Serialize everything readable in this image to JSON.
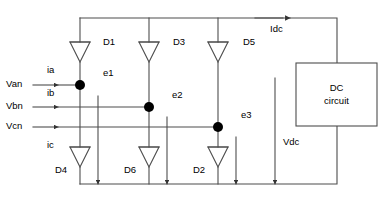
{
  "diagram": {
    "type": "electrical-schematic",
    "stroke_color": "#4d4d4d",
    "node_color": "#000000",
    "text_color": "#000000",
    "background_color": "#ffffff"
  },
  "sources": [
    {
      "id": "van",
      "label": "Van",
      "x": 6,
      "y": 81
    },
    {
      "id": "vbn",
      "label": "Vbn",
      "x": 6,
      "y": 104
    },
    {
      "id": "vcn",
      "label": "Vcn",
      "x": 6,
      "y": 124
    }
  ],
  "currents": [
    {
      "id": "ia",
      "label": "ia",
      "x": 47,
      "y": 68
    },
    {
      "id": "ib",
      "label": "ib",
      "x": 47,
      "y": 91
    },
    {
      "id": "ic",
      "label": "ic",
      "x": 47,
      "y": 143
    },
    {
      "id": "idc",
      "label": "Idc",
      "x": 270,
      "y": 27
    }
  ],
  "nodes": [
    {
      "id": "e1",
      "label": "e1",
      "x": 103,
      "y": 71
    },
    {
      "id": "e2",
      "label": "e2",
      "x": 172,
      "y": 93
    },
    {
      "id": "e3",
      "label": "e3",
      "x": 241,
      "y": 113
    }
  ],
  "diodes": [
    {
      "id": "d1",
      "label": "D1",
      "x": 103,
      "y": 40,
      "position": "upper-leg-a"
    },
    {
      "id": "d3",
      "label": "D3",
      "x": 173,
      "y": 40,
      "position": "upper-leg-b"
    },
    {
      "id": "d5",
      "label": "D5",
      "x": 243,
      "y": 40,
      "position": "upper-leg-c"
    },
    {
      "id": "d4",
      "label": "D4",
      "x": 55,
      "y": 168,
      "position": "lower-leg-a"
    },
    {
      "id": "d6",
      "label": "D6",
      "x": 124,
      "y": 168,
      "position": "lower-leg-b"
    },
    {
      "id": "d2",
      "label": "D2",
      "x": 193,
      "y": 168,
      "position": "lower-leg-c"
    }
  ],
  "voltages": [
    {
      "id": "vdc",
      "label": "Vdc",
      "x": 283,
      "y": 140
    }
  ],
  "load": {
    "id": "dc-circuit",
    "line1": "DC",
    "line2": "circuit",
    "x": 296,
    "y": 63,
    "width": 81,
    "height": 63
  }
}
